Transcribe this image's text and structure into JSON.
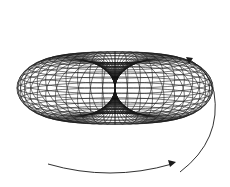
{
  "figure": {
    "line_color": "#1a1a1a",
    "background": "#ffffff",
    "arrows": [
      {
        "name": "upper-right-arrow",
        "direction": "up"
      },
      {
        "name": "bottom-arrow",
        "direction": "right"
      }
    ]
  }
}
